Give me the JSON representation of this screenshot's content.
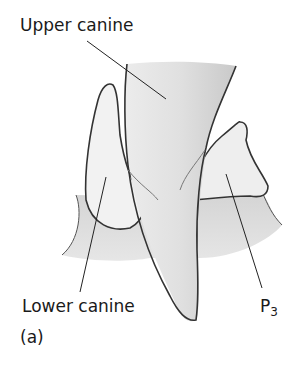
{
  "figure": {
    "panel_label": "(a)",
    "labels": {
      "upper_canine": "Upper canine",
      "lower_canine": "Lower canine",
      "p3_main": "P",
      "p3_sub": "3"
    }
  }
}
